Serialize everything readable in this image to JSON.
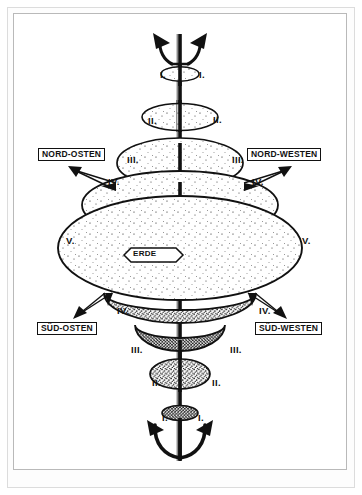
{
  "figure": {
    "center_label": "ERDE",
    "directions": {
      "north_east": "NORD-OSTEN",
      "north_west": "NORD-WESTEN",
      "south_east": "SÜD-OSTEN",
      "south_west": "SÜD-WESTEN"
    },
    "axis_top_icon": "trident-icon",
    "axis_bottom_icon": "anchor-icon",
    "levels": {
      "l1": "I.",
      "l2": "II.",
      "l3": "III.",
      "l4": "IV.",
      "l5": "V."
    },
    "level_marks": [
      {
        "numeral": "I.",
        "side": "left",
        "x": 160,
        "y": 70,
        "zone": "upper"
      },
      {
        "numeral": "I.",
        "side": "right",
        "x": 199,
        "y": 70,
        "zone": "upper"
      },
      {
        "numeral": "II.",
        "side": "left",
        "x": 148,
        "y": 116,
        "zone": "upper"
      },
      {
        "numeral": "II.",
        "side": "right",
        "x": 213,
        "y": 115,
        "zone": "upper"
      },
      {
        "numeral": "III.",
        "side": "left",
        "x": 127,
        "y": 155,
        "zone": "upper"
      },
      {
        "numeral": "III.",
        "side": "right",
        "x": 232,
        "y": 155,
        "zone": "upper"
      },
      {
        "numeral": "IV.",
        "side": "left",
        "x": 108,
        "y": 177,
        "zone": "upper"
      },
      {
        "numeral": "IV.",
        "side": "right",
        "x": 252,
        "y": 177,
        "zone": "upper"
      },
      {
        "numeral": "V.",
        "side": "left",
        "x": 66,
        "y": 236,
        "zone": "middle"
      },
      {
        "numeral": "V.",
        "side": "right",
        "x": 302,
        "y": 236,
        "zone": "middle"
      },
      {
        "numeral": "IV.",
        "side": "left",
        "x": 117,
        "y": 306,
        "zone": "lower"
      },
      {
        "numeral": "IV.",
        "side": "right",
        "x": 259,
        "y": 306,
        "zone": "lower"
      },
      {
        "numeral": "III.",
        "side": "left",
        "x": 131,
        "y": 345,
        "zone": "lower"
      },
      {
        "numeral": "III.",
        "side": "right",
        "x": 230,
        "y": 345,
        "zone": "lower"
      },
      {
        "numeral": "II.",
        "side": "left",
        "x": 152,
        "y": 378,
        "zone": "lower"
      },
      {
        "numeral": "II.",
        "side": "right",
        "x": 212,
        "y": 378,
        "zone": "lower"
      },
      {
        "numeral": "I.",
        "side": "left",
        "x": 162,
        "y": 413,
        "zone": "lower"
      },
      {
        "numeral": "I.",
        "side": "right",
        "x": 198,
        "y": 413,
        "zone": "lower"
      }
    ],
    "colors": {
      "ink": "#111111",
      "paper": "#ffffff",
      "frame": "#b9b9b9",
      "outer_frame": "#dcdcdc"
    }
  }
}
